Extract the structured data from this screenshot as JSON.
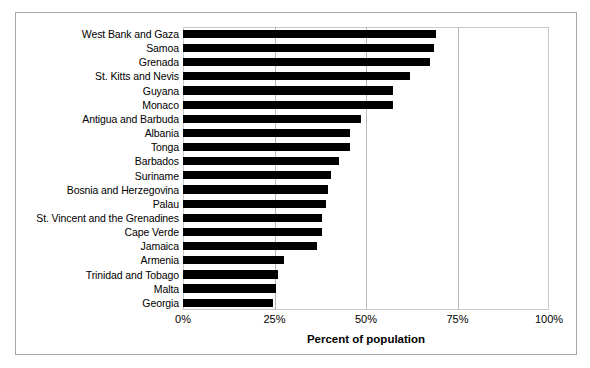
{
  "chart_data": {
    "type": "bar",
    "orientation": "horizontal",
    "title": "",
    "xlabel": "Percent of population",
    "ylabel": "",
    "xlim": [
      0,
      100
    ],
    "xticks": [
      "0%",
      "25%",
      "50%",
      "75%",
      "100%"
    ],
    "xtick_values": [
      0,
      25,
      50,
      75,
      100
    ],
    "grid": true,
    "grid_axis": "x",
    "legend": false,
    "bar_color": "#000000",
    "categories": [
      "West Bank and Gaza",
      "Samoa",
      "Grenada",
      "St. Kitts and Nevis",
      "Guyana",
      "Monaco",
      "Antigua and Barbuda",
      "Albania",
      "Tonga",
      "Barbados",
      "Suriname",
      "Bosnia and Herzegovina",
      "Palau",
      "St. Vincent and the Grenadines",
      "Cape Verde",
      "Jamaica",
      "Armenia",
      "Trinidad and Tobago",
      "Malta",
      "Georgia"
    ],
    "values": [
      69.0,
      68.5,
      67.5,
      62.0,
      57.5,
      57.5,
      48.5,
      45.5,
      45.5,
      42.5,
      40.5,
      39.5,
      39.0,
      38.0,
      38.0,
      36.5,
      27.5,
      26.0,
      25.5,
      24.5
    ]
  }
}
